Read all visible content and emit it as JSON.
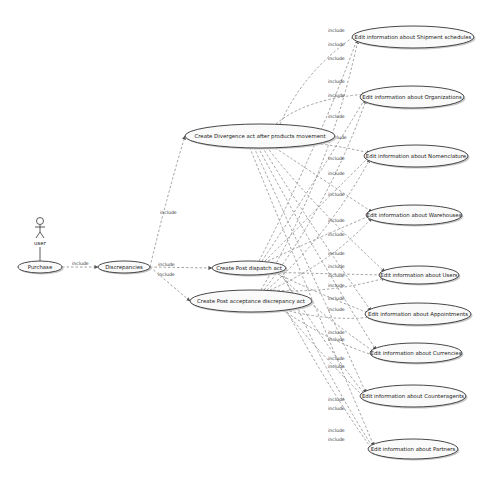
{
  "diagram": {
    "type": "uml-use-case",
    "actor": {
      "id": "user",
      "label": "user",
      "x": 40,
      "y": 233
    },
    "use_cases": [
      {
        "id": "purchase",
        "label": "Purchase",
        "x": 40,
        "y": 267,
        "rx": 22,
        "ry": 6
      },
      {
        "id": "discrepancies",
        "label": "Discrepancies",
        "x": 124,
        "y": 267,
        "rx": 26,
        "ry": 6
      },
      {
        "id": "divergence",
        "label": "Create Divergence act after products movement",
        "x": 260,
        "y": 136,
        "rx": 75,
        "ry": 12
      },
      {
        "id": "post_dispatch",
        "label": "Create Post dispatch act",
        "x": 249,
        "y": 268,
        "rx": 37,
        "ry": 7
      },
      {
        "id": "post_acceptance",
        "label": "Create Post acceptance discrepancy act",
        "x": 251,
        "y": 301,
        "rx": 61,
        "ry": 11
      },
      {
        "id": "shipment",
        "label": "Edit information about Shipment schedules",
        "x": 413,
        "y": 37,
        "rx": 61,
        "ry": 11
      },
      {
        "id": "organizations",
        "label": "Edit information about Organizations",
        "x": 412,
        "y": 97,
        "rx": 52,
        "ry": 11
      },
      {
        "id": "nomenclature",
        "label": "Edit information about Nomenclature",
        "x": 416,
        "y": 156,
        "rx": 52,
        "ry": 11
      },
      {
        "id": "warehouses",
        "label": "Edit information about Warehouses",
        "x": 414,
        "y": 215,
        "rx": 48,
        "ry": 10
      },
      {
        "id": "users",
        "label": "Edit information about Users",
        "x": 419,
        "y": 275,
        "rx": 40,
        "ry": 9
      },
      {
        "id": "appointments",
        "label": "Edit information about Appointments",
        "x": 418,
        "y": 314,
        "rx": 53,
        "ry": 11
      },
      {
        "id": "currencies",
        "label": "Edit information about Currencies",
        "x": 416,
        "y": 353,
        "rx": 46,
        "ry": 10
      },
      {
        "id": "counteragents",
        "label": "Edit information about Counteragents",
        "x": 413,
        "y": 396,
        "rx": 53,
        "ry": 11
      },
      {
        "id": "partners",
        "label": "Edit information about Partners",
        "x": 413,
        "y": 449,
        "rx": 45,
        "ry": 10
      }
    ],
    "relations": [
      {
        "from": "user",
        "to": "purchase",
        "type": "association"
      },
      {
        "from": "purchase",
        "to": "discrepancies",
        "type": "include",
        "label": "include",
        "lx": 72,
        "ly": 265
      },
      {
        "from": "discrepancies",
        "to": "divergence",
        "type": "include",
        "label": "include",
        "lx": 160,
        "ly": 214
      },
      {
        "from": "discrepancies",
        "to": "post_dispatch",
        "type": "include",
        "label": "include",
        "lx": 158,
        "ly": 266
      },
      {
        "from": "discrepancies",
        "to": "post_acceptance",
        "type": "include",
        "label": "include",
        "lx": 158,
        "ly": 276
      }
    ],
    "include_label": "include",
    "include_label_positions": [
      [
        328,
        32
      ],
      [
        328,
        46
      ],
      [
        328,
        60
      ],
      [
        328,
        83
      ],
      [
        328,
        97
      ],
      [
        328,
        118
      ],
      [
        330,
        139
      ],
      [
        328,
        160
      ],
      [
        328,
        175
      ],
      [
        328,
        196
      ],
      [
        328,
        222
      ],
      [
        328,
        236
      ],
      [
        328,
        255
      ],
      [
        328,
        268
      ],
      [
        328,
        277
      ],
      [
        328,
        287
      ],
      [
        328,
        300
      ],
      [
        328,
        311
      ],
      [
        328,
        334
      ],
      [
        328,
        341
      ],
      [
        328,
        360
      ],
      [
        328,
        368
      ],
      [
        328,
        401
      ],
      [
        328,
        410
      ],
      [
        328,
        432
      ],
      [
        328,
        441
      ]
    ],
    "colors": {
      "stroke": "#333333",
      "edge": "#8a8a8a",
      "fill": "#fafafa",
      "shadow": "#c8c8c8"
    }
  }
}
